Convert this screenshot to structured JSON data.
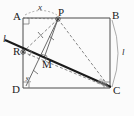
{
  "figure": {
    "background_color": "#fbfbfb",
    "stroke_color": "#4a4a4a",
    "bold_stroke_color": "#1a1a1a",
    "dashed_stroke_color": "#6b6b6b"
  },
  "vertices": {
    "A": {
      "label": "A",
      "x": 23,
      "y": 18
    },
    "B": {
      "label": "B",
      "x": 110,
      "y": 18
    },
    "C": {
      "label": "C",
      "x": 110,
      "y": 88
    },
    "D": {
      "label": "D",
      "x": 23,
      "y": 88
    },
    "P": {
      "label": "P",
      "x": 58,
      "y": 19
    },
    "R": {
      "label": "R",
      "x": 23,
      "y": 52
    },
    "M": {
      "label": "M",
      "x": 44,
      "y": 58
    }
  },
  "segment_labels": {
    "x": "x",
    "l_right": "l"
  },
  "angle_labels": {
    "y": "y"
  },
  "line_labels": {
    "l_left": "l"
  },
  "marks": {
    "right_angle_A": "right-angle-mark",
    "right_angle_D": "right-angle-mark",
    "right_angle_C": "right-angle-mark",
    "right_angle_R": "right-angle-mark",
    "right_angle_M": "right-angle-mark",
    "tick_RP": "single-tick",
    "tick_PM": "single-tick",
    "tick_DM": "single-tick"
  }
}
